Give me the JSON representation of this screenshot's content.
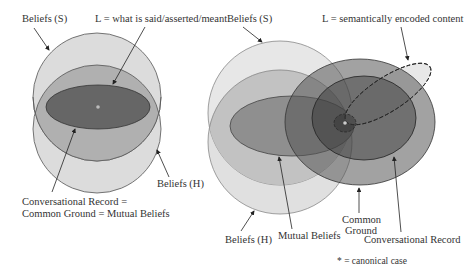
{
  "left_diagram": {
    "labels": {
      "beliefs_s": "Beliefs (S)",
      "l_def": "L = what is said/asserted/meant",
      "beliefs_h": "Beliefs (H)",
      "record_line1": "Conversational Record =",
      "record_line2": "Common Ground = Mutual Beliefs"
    }
  },
  "right_diagram": {
    "labels": {
      "beliefs_s": "Beliefs (S)",
      "l_def": "L = semantically encoded content",
      "beliefs_h": "Beliefs (H)",
      "mutual_beliefs": "Mutual Beliefs",
      "common_ground_line1": "Common",
      "common_ground_line2": "Ground",
      "conversational_record": "Conversational Record"
    }
  },
  "legend": {
    "canonical_case": "* = canonical case"
  },
  "colors": {
    "circle_fill": "#d9d9d9",
    "lens_fill": "#b3b3b3",
    "inner_ellipse_fill": "#666666",
    "outline": "#555555",
    "record_fill": "#8c8c8c",
    "common_ground_fill": "#6e6e6e"
  }
}
